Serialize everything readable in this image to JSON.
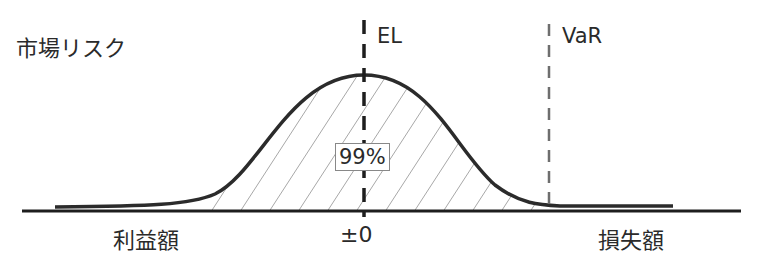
{
  "title": "市場リスク",
  "markers": {
    "el_label": "EL",
    "var_label": "VaR"
  },
  "area_label": "99%",
  "x_axis": {
    "left_label": "利益額",
    "center_label": "±0",
    "right_label": "損失額"
  },
  "colors": {
    "curve": "#2b2b2b",
    "axis": "#1e1e1e",
    "el_line": "#1e1e1e",
    "var_line": "#6e6e6e",
    "hatch": "#3a3a3a"
  }
}
